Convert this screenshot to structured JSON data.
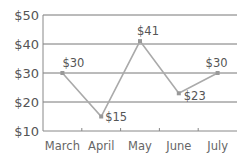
{
  "chart_data": {
    "type": "line",
    "title": "",
    "xlabel": "",
    "ylabel": "",
    "categories": [
      "March",
      "April",
      "May",
      "June",
      "July"
    ],
    "values": [
      30,
      15,
      41,
      23,
      30
    ],
    "data_labels": [
      "$30",
      "$15",
      "$41",
      "$23",
      "$30"
    ],
    "y_ticks": [
      "$50",
      "$40",
      "$30",
      "$20",
      "$10"
    ],
    "y_tick_values": [
      50,
      40,
      30,
      20,
      10
    ],
    "ylim": [
      10,
      50
    ],
    "grid": "horizontal",
    "legend": "none",
    "colors": {
      "line": "#aaaaaa",
      "marker": "#999999",
      "grid": "#777777",
      "axis": "#888888",
      "text": "#555555"
    }
  }
}
